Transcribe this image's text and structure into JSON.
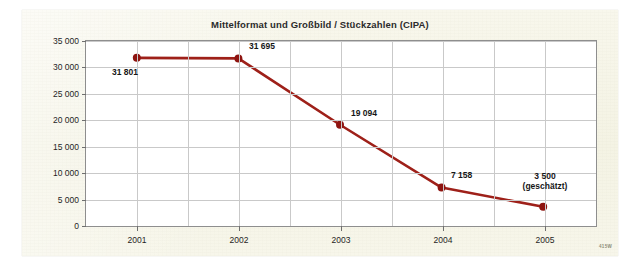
{
  "figure": {
    "title": "Mittelformat und Großbild / Stückzahlen (CIPA)",
    "watermark": "415W",
    "card_bg": "#f6f5e8",
    "plot_bg": "#ffffff",
    "frame_color": "#8e8e8e",
    "grid_color": "#c9c9c9"
  },
  "chart_data": {
    "type": "line",
    "title": "Mittelformat und Großbild / Stückzahlen (CIPA)",
    "xlabel": "",
    "ylabel": "",
    "x": [
      "2001",
      "2002",
      "2003",
      "2004",
      "2005"
    ],
    "categories": [
      "2001",
      "2002",
      "2003",
      "2004",
      "2005"
    ],
    "values": [
      31801,
      31695,
      19094,
      7158,
      3500
    ],
    "point_labels": [
      "31 801",
      "31 695",
      "19 094",
      "7 158",
      "3 500"
    ],
    "point_sublabels": [
      "",
      "",
      "",
      "",
      "(geschätzt)"
    ],
    "series": [
      {
        "name": "Stückzahlen (CIPA)",
        "values": [
          31801,
          31695,
          19094,
          7158,
          3500
        ],
        "color": "#9e2019",
        "marker_color": "#8e1410"
      }
    ],
    "ylim": [
      0,
      35000
    ],
    "ytick_values": [
      0,
      5000,
      10000,
      15000,
      20000,
      25000,
      30000,
      35000
    ],
    "ytick_labels": [
      "0",
      "5 000",
      "10 000",
      "15 000",
      "20 000",
      "25 000",
      "30 000",
      "35 000"
    ],
    "xtick_labels": [
      "2001",
      "2002",
      "2003",
      "2004",
      "2005"
    ],
    "grid": true,
    "legend": "none",
    "annotations": [
      {
        "text": "(geschätzt)",
        "attached_to": "2005"
      }
    ]
  }
}
